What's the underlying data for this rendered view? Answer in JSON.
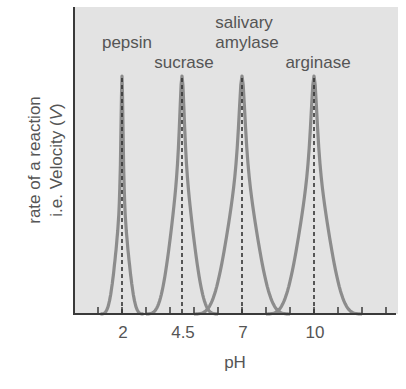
{
  "chart_data": {
    "type": "line",
    "title": "",
    "xlabel": "pH",
    "ylabel_line1": "rate of a reaction",
    "ylabel_line2_prefix": "i.e. Velocity (",
    "ylabel_line2_var": "V",
    "ylabel_line2_suffix": ")",
    "xlim": [
      0,
      13.5
    ],
    "ylim": [
      0,
      1
    ],
    "grid": false,
    "legend": "none (curves labelled directly above peaks)",
    "x_tick_positions": [
      1,
      2,
      3,
      4,
      5,
      6,
      7,
      8,
      9,
      10,
      11,
      12,
      13
    ],
    "x_tick_labels": [
      {
        "value": 2,
        "label": "2"
      },
      {
        "value": 4.5,
        "label": "4.5"
      },
      {
        "value": 7,
        "label": "7"
      },
      {
        "value": 10,
        "label": "10"
      }
    ],
    "series": [
      {
        "name": "pepsin",
        "optimum_pH": 2,
        "range": [
          1.1,
          2.9
        ],
        "peak_value": 1.0,
        "width": "narrow"
      },
      {
        "name": "sucrase",
        "optimum_pH": 4.5,
        "range": [
          3.0,
          6.0
        ],
        "peak_value": 1.0,
        "width": "medium"
      },
      {
        "name": "salivary amylase",
        "optimum_pH": 7,
        "range": [
          5.0,
          9.0
        ],
        "peak_value": 1.0,
        "width": "wide"
      },
      {
        "name": "arginase",
        "optimum_pH": 10,
        "range": [
          8.0,
          12.0
        ],
        "peak_value": 1.0,
        "width": "wide"
      }
    ],
    "annotations": [
      {
        "text": "pepsin",
        "x": 2
      },
      {
        "text": "sucrase",
        "x": 4.5
      },
      {
        "text": "salivary",
        "x": 7,
        "line": 1
      },
      {
        "text": "amylase",
        "x": 7,
        "line": 2
      },
      {
        "text": "arginase",
        "x": 10
      }
    ],
    "dashed_optimum_lines_at": [
      2,
      4.5,
      7,
      10
    ],
    "colors": {
      "background": "#e3e3e3",
      "curve": "#8c8c8c",
      "dashed": "#333333",
      "axis": "#3a3a3a",
      "text": "#555555"
    }
  }
}
